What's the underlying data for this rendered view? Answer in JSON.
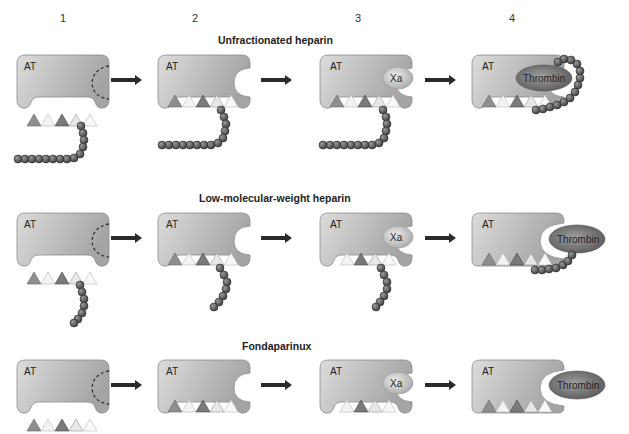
{
  "columns": [
    "1",
    "2",
    "3",
    "4"
  ],
  "rows": [
    {
      "title": "Unfractionated heparin"
    },
    {
      "title": "Low-molecular-weight heparin"
    },
    {
      "title": "Fondaparinux"
    }
  ],
  "labels": {
    "antithrombin": "AT",
    "factor_xa": "Xa",
    "thrombin": "Thrombin"
  },
  "colors": {
    "at_light": "#d6d6d6",
    "at_dark": "#a8a8a8",
    "arrow": "#2a2a2a",
    "bead": "#555555",
    "xa_fill": "#c8c8c8",
    "thrombin_fill": "#7a7a7a"
  }
}
